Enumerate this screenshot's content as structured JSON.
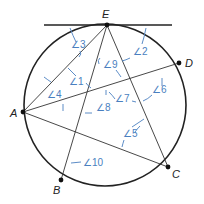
{
  "diagram": {
    "colors": {
      "line": "#222222",
      "annotation": "#4a7fc0",
      "background": "#ffffff"
    },
    "circle": {
      "cx": 105,
      "cy": 105,
      "r": 81
    },
    "tangent_line": {
      "x1": 44,
      "y1": 25,
      "x2": 172,
      "y2": 25
    },
    "points": [
      {
        "id": "E",
        "label": "E",
        "x": 107,
        "y": 25,
        "label_x": 102,
        "label_y": 18
      },
      {
        "id": "D",
        "label": "D",
        "x": 179,
        "y": 63,
        "label_x": 186,
        "label_y": 66
      },
      {
        "id": "A",
        "label": "A",
        "x": 23,
        "y": 112,
        "label_x": 10,
        "label_y": 116
      },
      {
        "id": "B",
        "label": "B",
        "x": 61,
        "y": 180,
        "label_x": 53,
        "label_y": 194
      },
      {
        "id": "C",
        "label": "C",
        "x": 168,
        "y": 167,
        "label_x": 173,
        "label_y": 178
      }
    ],
    "segments": [
      {
        "from": "A",
        "to": "E"
      },
      {
        "from": "E",
        "to": "B"
      },
      {
        "from": "E",
        "to": "C"
      },
      {
        "from": "A",
        "to": "D"
      },
      {
        "from": "A",
        "to": "C"
      }
    ],
    "angles": [
      {
        "id": "1",
        "label": "∠1",
        "x": 70,
        "y": 84
      },
      {
        "id": "2",
        "label": "∠2",
        "x": 133,
        "y": 55
      },
      {
        "id": "3",
        "label": "∠3",
        "x": 71,
        "y": 47
      },
      {
        "id": "4",
        "label": "∠4",
        "x": 50,
        "y": 98
      },
      {
        "id": "5",
        "label": "∠5",
        "x": 123,
        "y": 137
      },
      {
        "id": "6",
        "label": "∠6",
        "x": 152,
        "y": 93
      },
      {
        "id": "7",
        "label": "∠7",
        "x": 116,
        "y": 101
      },
      {
        "id": "8",
        "label": "∠8",
        "x": 96,
        "y": 110
      },
      {
        "id": "9",
        "label": "∠9",
        "x": 104,
        "y": 68
      },
      {
        "id": "10",
        "label": "∠10",
        "x": 84,
        "y": 166
      }
    ]
  }
}
